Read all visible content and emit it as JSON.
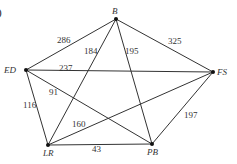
{
  "part_label": ")",
  "nodes": [
    {
      "id": "B",
      "label": "B",
      "x": 116,
      "y": 19
    },
    {
      "id": "ED",
      "label": "ED",
      "x": 26,
      "y": 70
    },
    {
      "id": "FS",
      "label": "FS",
      "x": 213,
      "y": 72
    },
    {
      "id": "LR",
      "label": "LR",
      "x": 48,
      "y": 145
    },
    {
      "id": "PB",
      "label": "PB",
      "x": 152,
      "y": 144
    }
  ],
  "edges": [
    {
      "from": "B",
      "to": "ED",
      "weight": "286"
    },
    {
      "from": "B",
      "to": "LR",
      "weight": "184"
    },
    {
      "from": "B",
      "to": "PB",
      "weight": "195"
    },
    {
      "from": "B",
      "to": "FS",
      "weight": "325"
    },
    {
      "from": "ED",
      "to": "FS",
      "weight": "237"
    },
    {
      "from": "ED",
      "to": "LR",
      "weight": "116"
    },
    {
      "from": "ED",
      "to": "PB",
      "weight": "91"
    },
    {
      "from": "LR",
      "to": "FS",
      "weight": "160"
    },
    {
      "from": "LR",
      "to": "PB",
      "weight": "43"
    },
    {
      "from": "PB",
      "to": "FS",
      "weight": "197"
    }
  ],
  "edge_label_positions": [
    {
      "x": 57,
      "y": 36
    },
    {
      "x": 84,
      "y": 47
    },
    {
      "x": 125,
      "y": 47
    },
    {
      "x": 168,
      "y": 37
    },
    {
      "x": 59,
      "y": 64
    },
    {
      "x": 23,
      "y": 101
    },
    {
      "x": 49,
      "y": 88
    },
    {
      "x": 72,
      "y": 120
    },
    {
      "x": 92,
      "y": 145
    },
    {
      "x": 184,
      "y": 111
    }
  ],
  "colors": {
    "line": "#333333",
    "node": "#111111",
    "text": "#333333"
  }
}
